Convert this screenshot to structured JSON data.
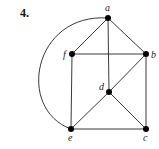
{
  "problem": {
    "number": "4."
  },
  "graph": {
    "vertices": [
      {
        "id": "a",
        "label": "a",
        "x": 108,
        "y": 18,
        "label_x": 105,
        "label_y": 11
      },
      {
        "id": "b",
        "label": "b",
        "x": 146,
        "y": 54,
        "label_x": 151,
        "label_y": 58
      },
      {
        "id": "c",
        "label": "c",
        "x": 146,
        "y": 129,
        "label_x": 143,
        "label_y": 141
      },
      {
        "id": "d",
        "label": "d",
        "x": 109,
        "y": 92,
        "label_x": 99,
        "label_y": 90
      },
      {
        "id": "e",
        "label": "e",
        "x": 71,
        "y": 129,
        "label_x": 68,
        "label_y": 141
      },
      {
        "id": "f",
        "label": "f",
        "x": 72,
        "y": 54,
        "label_x": 63,
        "label_y": 58
      }
    ],
    "edges": [
      {
        "from": "a",
        "to": "f",
        "type": "straight"
      },
      {
        "from": "a",
        "to": "b",
        "type": "straight"
      },
      {
        "from": "a",
        "to": "d",
        "type": "straight"
      },
      {
        "from": "a",
        "to": "e",
        "type": "arc"
      },
      {
        "from": "f",
        "to": "b",
        "type": "straight"
      },
      {
        "from": "f",
        "to": "e",
        "type": "straight"
      },
      {
        "from": "b",
        "to": "d",
        "type": "straight"
      },
      {
        "from": "b",
        "to": "c",
        "type": "straight"
      },
      {
        "from": "d",
        "to": "e",
        "type": "straight"
      },
      {
        "from": "d",
        "to": "c",
        "type": "straight"
      },
      {
        "from": "e",
        "to": "c",
        "type": "straight"
      }
    ]
  }
}
